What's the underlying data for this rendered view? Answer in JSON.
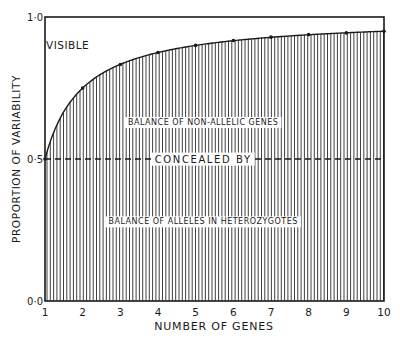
{
  "chart_data": {
    "type": "area",
    "title": "",
    "xlabel": "NUMBER OF GENES",
    "ylabel": "PROPORTION OF VARIABILITY",
    "xlim": [
      1,
      10
    ],
    "ylim": [
      0,
      1
    ],
    "x_ticks": [
      "1",
      "2",
      "3",
      "4",
      "5",
      "6",
      "7",
      "8",
      "9",
      "10"
    ],
    "y_ticks": [
      {
        "value": 0.0,
        "label": "0·0"
      },
      {
        "value": 0.5,
        "label": "0·5"
      },
      {
        "value": 1.0,
        "label": "1·0"
      }
    ],
    "grid": false,
    "series": [
      {
        "name": "Concealed proportion of variability",
        "x": [
          1,
          2,
          3,
          4,
          5,
          6,
          7,
          8,
          9,
          10
        ],
        "values": [
          0.5,
          0.75,
          0.833,
          0.875,
          0.9,
          0.917,
          0.929,
          0.938,
          0.944,
          0.95
        ]
      }
    ],
    "reference_line": {
      "y": 0.5,
      "style": "dashed"
    },
    "annotations": [
      {
        "text": "VISIBLE",
        "x": 1.6,
        "y": 0.9
      },
      {
        "text": "BALANCE OF NON-ALLELIC GENES",
        "x": 5.2,
        "y": 0.63
      },
      {
        "text": "CONCEALED BY",
        "x": 5.2,
        "y": 0.5
      },
      {
        "text": "BALANCE OF ALLELES IN HETEROZYGOTES",
        "x": 5.2,
        "y": 0.28
      }
    ],
    "fill": "vertical hatching below curve"
  }
}
